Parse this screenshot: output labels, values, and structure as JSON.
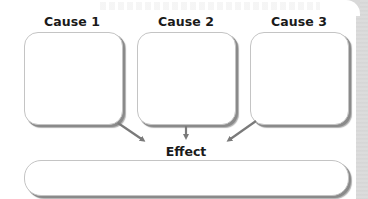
{
  "diagram": {
    "type": "cause-and-effect organizer",
    "causes": [
      {
        "label": "Cause 1",
        "content": ""
      },
      {
        "label": "Cause 2",
        "content": ""
      },
      {
        "label": "Cause 3",
        "content": ""
      }
    ],
    "effect": {
      "label": "Effect",
      "content": ""
    },
    "colors": {
      "box_border": "#c4c4c4",
      "box_shadow": "#8a8a8a",
      "arrow": "#7a7a7a",
      "text": "#1a1a1a",
      "edge_strip": "#d9d9d9"
    },
    "connections": [
      {
        "from": "Cause 1",
        "to": "Effect",
        "icon": "arrow-down-right-icon"
      },
      {
        "from": "Cause 2",
        "to": "Effect",
        "icon": "arrow-down-icon"
      },
      {
        "from": "Cause 3",
        "to": "Effect",
        "icon": "arrow-down-left-icon"
      }
    ]
  }
}
